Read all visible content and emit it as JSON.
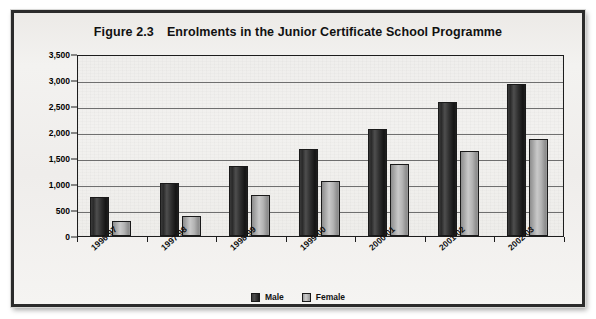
{
  "chart_data": {
    "type": "bar",
    "title_figure_number": "Figure 2.3",
    "title_text": "Enrolments in the Junior Certificate School Programme",
    "xlabel": "",
    "ylabel": "",
    "ylim": [
      0,
      3500
    ],
    "ytick_step": 500,
    "grid": true,
    "legend_position": "bottom-center",
    "categories": [
      "1996-97",
      "1997-98",
      "1998-99",
      "1999-00",
      "2000-01",
      "2001-02",
      "2002-03"
    ],
    "ytick_labels": [
      "3,500",
      "3,000",
      "2,500",
      "2,000",
      "1,500",
      "1,000",
      "500",
      "0"
    ],
    "ytick_values": [
      3500,
      3000,
      2500,
      2000,
      1500,
      1000,
      500,
      0
    ],
    "series": [
      {
        "name": "Male",
        "color": "#2a2a2a",
        "values": [
          750,
          1010,
          1340,
          1670,
          2060,
          2580,
          2930
        ]
      },
      {
        "name": "Female",
        "color": "#b4b4b4",
        "values": [
          280,
          390,
          790,
          1050,
          1390,
          1630,
          1870
        ]
      }
    ]
  },
  "legend": {
    "items": [
      {
        "label": "Male",
        "swatch": "male"
      },
      {
        "label": "Female",
        "swatch": "female"
      }
    ]
  },
  "colors": {
    "frame_border": "#2b2b2b",
    "panel_background": "#f0f0ef",
    "plot_border": "#1d1d1d",
    "gridline": "#6f6f6f",
    "male_bar": "#2a2a2a",
    "female_bar": "#b4b4b4",
    "text": "#111111"
  }
}
